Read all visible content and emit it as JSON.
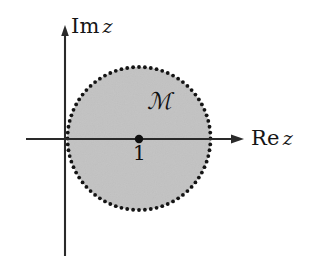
{
  "figure": {
    "type": "complex-plane-diagram",
    "background_color": "#ffffff",
    "axes": {
      "real": {
        "label_roman": "Re",
        "label_variable": "z",
        "label": "Re z",
        "color": "#151515",
        "arrow": "right-arrow-icon",
        "x_start": 26,
        "x_end": 243,
        "y": 139
      },
      "imaginary": {
        "label_roman": "Im",
        "label_variable": "z",
        "label": "Im z",
        "color": "#151515",
        "arrow": "up-arrow-icon",
        "x": 65,
        "y_top": 28,
        "y_bottom": 256
      }
    },
    "region": {
      "name": "M",
      "label": "ℳ",
      "label_x": 147,
      "label_y": 90,
      "fill_color": "#c4c4c4",
      "boundary_style": "dotted",
      "boundary_color": "#141414",
      "boundary_dot_radius": 1.9,
      "boundary_dot_count": 76,
      "center_x": 139,
      "center_y": 138.5,
      "radius": 71.5
    },
    "marked_point": {
      "label": "1",
      "x": 139,
      "y": 139,
      "dot_radius": 4.2,
      "color": "#101010",
      "label_x": 133,
      "label_y": 143
    }
  }
}
